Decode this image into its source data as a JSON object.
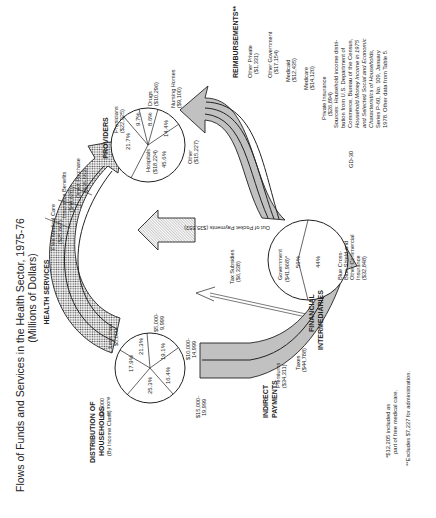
{
  "title": {
    "line1": "Flows of Funds and Services in the Health Sector, 1975-76",
    "line2": "(Millions of Dollars)"
  },
  "sections": {
    "health_services": "HEALTH SERVICES",
    "providers": "PROVIDERS",
    "reimbursements": "REIMBURSEMENTS**",
    "distribution_line1": "DISTRIBUTION OF",
    "distribution_line2": "HOUSEHOLDS",
    "distribution_sub": "(By Income Class)",
    "indirect_line1": "INDIRECT",
    "indirect_line2": "PAYMENTS",
    "financial_line1": "FINANCIAL",
    "financial_line2": "INTERMEDIARIES"
  },
  "health_services_flows": [
    {
      "label": "Free Medical Care",
      "value": "($25,667)"
    },
    {
      "label": "Insurance Benefits",
      "value": "($44,626)"
    },
    {
      "label": "Direct Purchase",
      "value": "($35,553)"
    }
  ],
  "providers_pie": {
    "slices": [
      {
        "label": "Physicians",
        "value": "($22,925)",
        "pct": "21.7%"
      },
      {
        "label": "Drugs",
        "value": "($10,296)",
        "pct": "9.7%"
      },
      {
        "label": "Nursing Homes",
        "value": "($9,100)",
        "pct": "8.6%"
      },
      {
        "label": "Other",
        "value": "($15,227)",
        "pct": "14.4%"
      },
      {
        "label": "Hospitals",
        "value": "($18,224)",
        "pct": "45.6%"
      }
    ]
  },
  "households_pie": {
    "slices": [
      {
        "label_line1": "Less than",
        "label_line2": "$5,000",
        "pct": "17.9%"
      },
      {
        "label_line1": "$5,000-",
        "label_line2": "9,999",
        "pct": "21.3%"
      },
      {
        "label_line1": "$10,000-",
        "label_line2": "14,999",
        "pct": "19.1%"
      },
      {
        "label_line1": "$15,000-",
        "label_line2": "19,999",
        "pct": "16.4%"
      },
      {
        "label_line1": "$20,000",
        "label_line2": "or more",
        "pct": "25.3%"
      }
    ]
  },
  "out_of_pocket": {
    "label": "Out of Pocket Payments ($35,553)"
  },
  "tax_subsidies": {
    "label": "Tax Subsidies",
    "value": "($6,338)"
  },
  "indirect_flows": [
    {
      "label": "Premiums",
      "value": "($34,311)"
    },
    {
      "label": "Taxes",
      "value": "($44,788)"
    }
  ],
  "financial_pie": {
    "slices": [
      {
        "label": "Government",
        "value": "($41,968)*",
        "pct": "56%"
      },
      {
        "label_lines": [
          "Blue Cross-",
          "Blue Shield and",
          "Other Commercial",
          "Insurance",
          "($32,848)"
        ],
        "pct": "44%"
      }
    ]
  },
  "reimbursement_flows": [
    {
      "label": "Other Private",
      "value": "($1,331)"
    },
    {
      "label": "Other Government",
      "value": "($17,154)"
    },
    {
      "label": "Medicaid",
      "value": "($12,435)"
    },
    {
      "label": "Medicare",
      "value": "($14,120)"
    },
    {
      "label": "Private Insurance",
      "value": "($26,894)"
    }
  ],
  "sources_lines": [
    "Sources: Household income distri-",
    "bution from U.S. Department of",
    "Commerce, Bureau of the Census,",
    "Household Money Income in 1975",
    "and Selected Social and Economic",
    "Characteristics of Households,",
    "Series P-60, No. 109, January",
    "1978. Other data from Table 5."
  ],
  "figure_id": "GD-30",
  "footnotes": {
    "single_line1": "*$12,205 included as",
    "single_line2": "part of free medical care.",
    "double": "**Excludes $7,227 for administration."
  },
  "colors": {
    "ink": "#222222",
    "paper": "#ffffff",
    "stipple": "#9a9a9a"
  }
}
